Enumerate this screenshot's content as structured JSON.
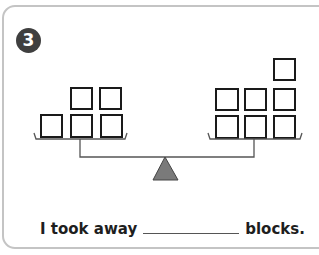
{
  "problem": {
    "number": "3",
    "sentence": {
      "prefix": "I took away",
      "blank_value": "",
      "suffix": "blocks."
    }
  },
  "balance": {
    "left_pan": {
      "block_count": 5,
      "rows": [
        {
          "row": "top",
          "blocks": 2
        },
        {
          "row": "bottom",
          "blocks": 3
        }
      ]
    },
    "right_pan": {
      "block_count": 7,
      "rows": [
        {
          "row": "top",
          "blocks": 1
        },
        {
          "row": "middle",
          "blocks": 3
        },
        {
          "row": "bottom",
          "blocks": 3
        }
      ]
    },
    "fulcrum_color": "#7a7a7a"
  },
  "colors": {
    "badge": "#3f3f3f",
    "block_stroke": "#1a1a1a",
    "card_border": "#c4c4c4"
  }
}
